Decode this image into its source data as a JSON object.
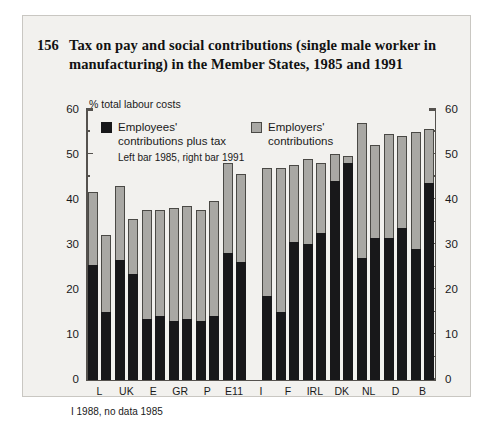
{
  "figure": {
    "number": "156",
    "title": "Tax on pay and social contributions (single male worker in manufacturing) in the Member States, 1985 and 1991",
    "unit_label": "% total labour costs",
    "footnote": "I 1988, no data 1985"
  },
  "legend": {
    "series_1_line1": "Employees'",
    "series_1_line2": "contributions plus tax",
    "series_2_line1": "Employers'",
    "series_2_line2": "contributions",
    "note": "Left bar 1985, right bar 1991",
    "color_employees": "#18181a",
    "color_employers": "#a9a8a4"
  },
  "axis": {
    "y_ticks": [
      "60",
      "50",
      "40",
      "30",
      "20",
      "10",
      "0"
    ],
    "y_min": 0,
    "y_max": 60
  },
  "chart_data": {
    "type": "bar",
    "title": "Tax on pay and social contributions (single male worker in manufacturing) in the Member States, 1985 and 1991",
    "xlabel": "",
    "ylabel": "% total labour costs",
    "ylim": [
      0,
      60
    ],
    "grid": false,
    "legend_position": "top-left-inside",
    "stacked": true,
    "categories": [
      "L",
      "UK",
      "E",
      "GR",
      "P",
      "E11",
      "I",
      "F",
      "IRL",
      "DK",
      "NL",
      "D",
      "B"
    ],
    "bar_pairs": [
      "1985",
      "1991"
    ],
    "series": [
      {
        "name": "Employees' contributions plus tax",
        "color": "#18181a",
        "values_1985": [
          25.5,
          26.5,
          13.5,
          13.0,
          13.0,
          28.0,
          null,
          15.0,
          30.0,
          44.0,
          27.0,
          31.5,
          29.0
        ],
        "values_1991": [
          15.0,
          23.5,
          14.0,
          13.5,
          14.0,
          26.0,
          18.5,
          30.5,
          32.5,
          48.0,
          31.5,
          33.5,
          43.5
        ]
      },
      {
        "name": "Employers' contributions",
        "color": "#a9a8a4",
        "values_1985": [
          16.0,
          16.5,
          24.0,
          25.0,
          24.5,
          20.0,
          null,
          32.0,
          19.0,
          6.0,
          30.0,
          23.0,
          26.0
        ],
        "values_1991": [
          17.0,
          12.0,
          23.5,
          25.0,
          25.5,
          19.5,
          28.5,
          17.0,
          15.5,
          1.5,
          20.5,
          20.5,
          12.0
        ]
      }
    ],
    "totals_1985": [
      41.5,
      43.0,
      37.5,
      38.0,
      37.5,
      48.0,
      null,
      47.0,
      49.0,
      50.0,
      57.0,
      54.5,
      55.0
    ],
    "totals_1991": [
      32.0,
      35.5,
      37.5,
      38.5,
      39.5,
      45.5,
      47.0,
      47.5,
      48.0,
      49.5,
      52.0,
      54.0,
      55.5
    ],
    "annotations": [
      "I 1988, no data 1985"
    ]
  }
}
